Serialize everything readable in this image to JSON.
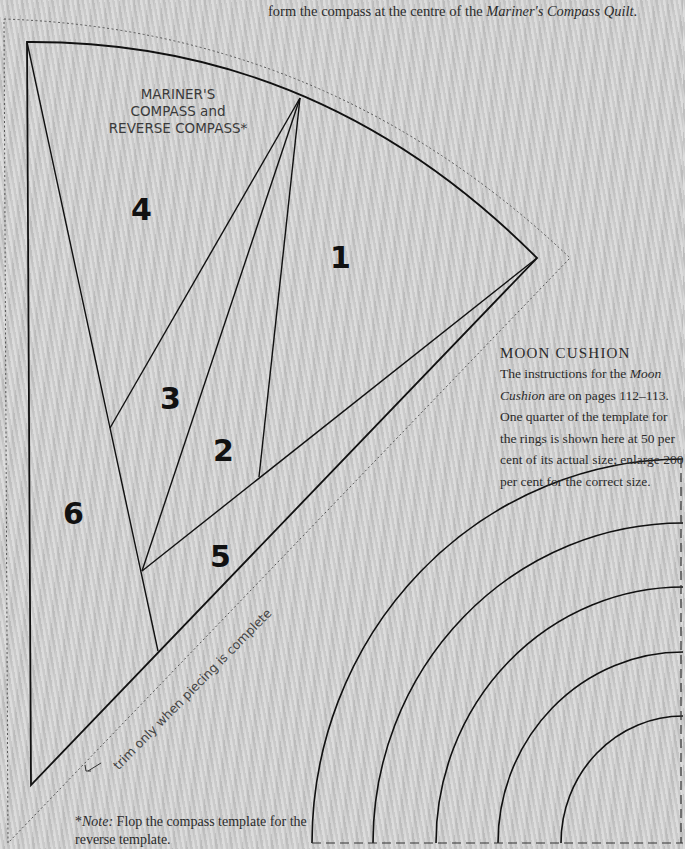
{
  "intro": {
    "line_prefix": "form the compass at the centre of the ",
    "line_italic": "Mariner's Compass Quilt",
    "line_suffix": "."
  },
  "compass_template": {
    "title_line1": "MARINER'S",
    "title_line2": "COMPASS and",
    "title_line3": "REVERSE COMPASS*",
    "piece_labels": [
      "1",
      "2",
      "3",
      "4",
      "5",
      "6"
    ],
    "trim_label": "trim only when piecing is complete",
    "trim_arrow_icon": "↙"
  },
  "moon_cushion": {
    "heading": "Moon Cushion",
    "body_part1": "The instructions for the ",
    "body_italic": "Moon Cushion",
    "body_part2": " are on pages 112–113. One quarter of the template for the rings is shown here at 50 per cent of its actual size; enlarge 200 per cent for the correct size.",
    "ring_count": 5
  },
  "note": {
    "prefix": "*",
    "label_italic": "Note:",
    "text": " Flop the compass template for the reverse template."
  },
  "colors": {
    "background": "#cdcdcd",
    "line": "#111111",
    "dashed_line": "#555555",
    "text": "#2b2b2b"
  }
}
